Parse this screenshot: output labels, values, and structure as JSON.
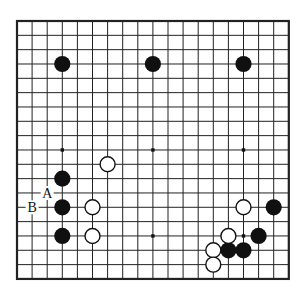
{
  "diagram": {
    "kind": "go-board-diagram",
    "board_lines": 19,
    "colors": {
      "background": "#ffffff",
      "grid_line": "#222222",
      "black_stone": "#101010",
      "white_stone_fill": "#ffffff",
      "white_stone_outline": "#111111",
      "star_point": "#111111",
      "label_text": "#111111"
    },
    "black_stones": [
      {
        "col": 3,
        "row": 3
      },
      {
        "col": 9,
        "row": 3
      },
      {
        "col": 15,
        "row": 3
      },
      {
        "col": 3,
        "row": 11
      },
      {
        "col": 3,
        "row": 13
      },
      {
        "col": 3,
        "row": 15
      },
      {
        "col": 17,
        "row": 13
      },
      {
        "col": 16,
        "row": 15
      },
      {
        "col": 14,
        "row": 16
      },
      {
        "col": 15,
        "row": 16
      }
    ],
    "white_stones": [
      {
        "col": 6,
        "row": 10
      },
      {
        "col": 5,
        "row": 13
      },
      {
        "col": 5,
        "row": 15
      },
      {
        "col": 15,
        "row": 13
      },
      {
        "col": 14,
        "row": 15
      },
      {
        "col": 13,
        "row": 16
      },
      {
        "col": 13,
        "row": 17
      }
    ],
    "visible_star_points": [
      {
        "col": 3,
        "row": 9
      },
      {
        "col": 9,
        "row": 9
      },
      {
        "col": 15,
        "row": 9
      },
      {
        "col": 9,
        "row": 15
      },
      {
        "col": 15,
        "row": 15
      }
    ],
    "labels": [
      {
        "text": "A",
        "col": 2,
        "row": 12
      },
      {
        "text": "B",
        "col": 1,
        "row": 13
      }
    ]
  }
}
